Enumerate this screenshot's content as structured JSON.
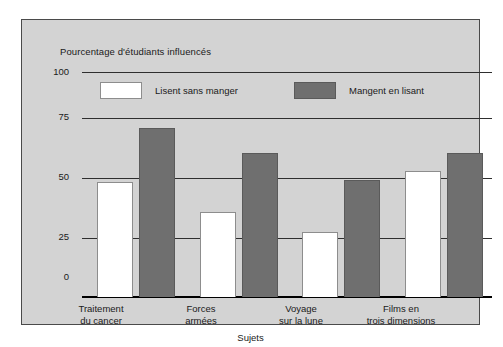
{
  "chart_data": {
    "type": "bar",
    "title": "Pourcentage d'étudiants influencés",
    "xlabel": "Sujets",
    "ylabel": "Pourcentage d'étudiants influencés",
    "categories": [
      "Traitement du cancer",
      "Forces armées",
      "Voyage sur la lune",
      "Films en trois dimensions"
    ],
    "category_lines": [
      [
        "Traitement",
        "du cancer"
      ],
      [
        "Forces",
        "armées"
      ],
      [
        "Voyage",
        "sur la lune"
      ],
      [
        "Films en",
        "trois dimensions"
      ]
    ],
    "series": [
      {
        "name": "Lisent sans manger",
        "color": "#ffffff",
        "values": [
          51,
          38,
          29,
          56
        ]
      },
      {
        "name": "Mangent en lisant",
        "color": "#6f6f6f",
        "values": [
          75,
          64,
          52,
          64
        ]
      }
    ],
    "ylim": [
      0,
      100
    ],
    "yticks": [
      0,
      25,
      50,
      75,
      100
    ],
    "ytick_labels": [
      "0",
      "25",
      "50",
      "75",
      "100"
    ],
    "grid": true,
    "legend_position": "top-inside"
  },
  "legend": {
    "items": [
      {
        "label": "Lisent sans manger"
      },
      {
        "label": "Mangent en lisant"
      }
    ]
  },
  "colors": {
    "panel_background": "#d3d3d3",
    "panel_border": "#4a4a4a",
    "gridline": "#2e2e2e",
    "axis": "#000000",
    "series_white": "#ffffff",
    "series_gray": "#6f6f6f",
    "text": "#1a1a1a"
  }
}
